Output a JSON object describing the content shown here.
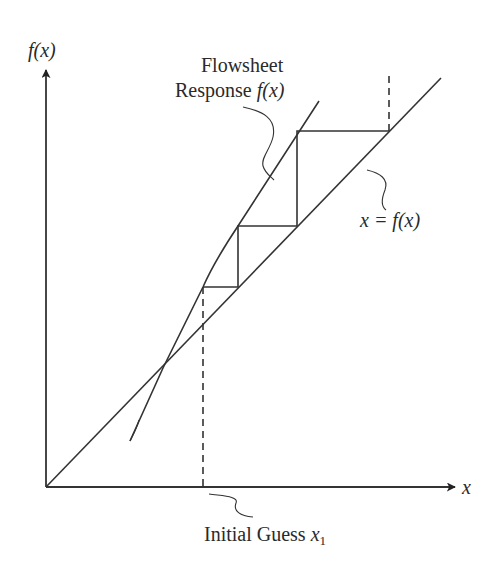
{
  "diagram": {
    "type": "successive-substitution convergence diagram",
    "axes": {
      "y_label": "f(x)",
      "x_label": "x"
    },
    "labels": {
      "flowsheet_line1": "Flowsheet",
      "flowsheet_line2_prefix": "Response ",
      "flowsheet_line2_func": "f(x)",
      "identity_line": "x = f(x)",
      "initial_guess_prefix": "Initial Guess ",
      "initial_guess_var": "x",
      "initial_guess_sub": "1"
    },
    "colors": {
      "line": "#333333",
      "text": "#2a2a2a",
      "background": "#ffffff"
    }
  }
}
